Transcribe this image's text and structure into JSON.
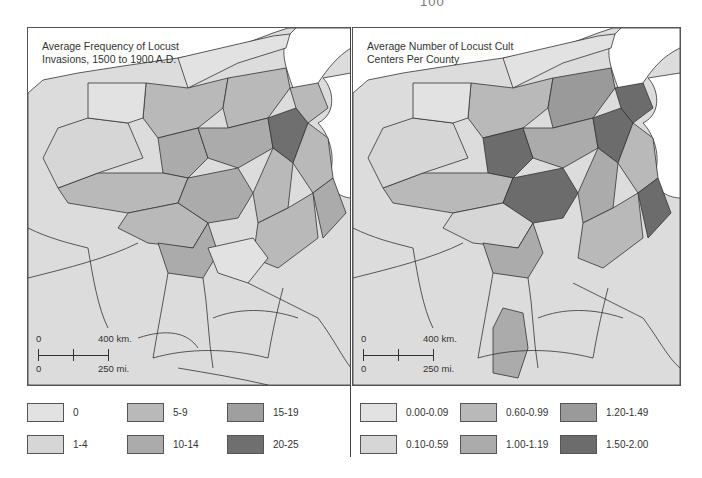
{
  "page": {
    "number": "100"
  },
  "maps": [
    {
      "title_line1": "Average Frequency of Locust",
      "title_line2": "Invasions, 1500 to 1900 A.D.",
      "scale": {
        "km_zero": "0",
        "km_label": "400 km.",
        "mi_zero": "0",
        "mi_label": "250 mi."
      },
      "legend": [
        {
          "label": "0",
          "color": "#e2e2e2"
        },
        {
          "label": "5-9",
          "color": "#b9b9b9"
        },
        {
          "label": "15-19",
          "color": "#9f9f9f"
        },
        {
          "label": "1-4",
          "color": "#d6d6d6"
        },
        {
          "label": "10-14",
          "color": "#ababab"
        },
        {
          "label": "20-25",
          "color": "#6f6f6f"
        }
      ]
    },
    {
      "title_line1": "Average Number of Locust Cult",
      "title_line2": "Centers Per County",
      "scale": {
        "km_zero": "0",
        "km_label": "400 km.",
        "mi_zero": "0",
        "mi_label": "250 mi."
      },
      "legend": [
        {
          "label": "0.00-0.09",
          "color": "#e2e2e2"
        },
        {
          "label": "0.60-0.99",
          "color": "#b9b9b9"
        },
        {
          "label": "1.20-1.49",
          "color": "#9a9a9a"
        },
        {
          "label": "0.10-0.59",
          "color": "#d6d6d6"
        },
        {
          "label": "1.00-1.19",
          "color": "#ababab"
        },
        {
          "label": "1.50-2.00",
          "color": "#6c6c6c"
        }
      ]
    }
  ],
  "colors": {
    "land_default": "#dcdcdc",
    "sea": "#ffffff",
    "border": "#333333"
  }
}
